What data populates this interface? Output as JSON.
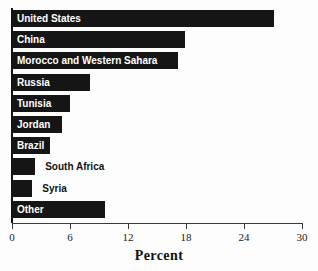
{
  "chart_data": {
    "type": "bar",
    "orientation": "horizontal",
    "title": "",
    "xlabel": "Percent",
    "ylabel": "",
    "xlim": [
      0,
      30
    ],
    "xticks": [
      0,
      6,
      12,
      18,
      24,
      30
    ],
    "xtick_labels": [
      "0",
      "6",
      "12",
      "18",
      "24",
      "30"
    ],
    "grid": false,
    "legend": null,
    "bar_color": "#151515",
    "background_color": "#fdfdfd",
    "categories": [
      "United States",
      "China",
      "Morocco and Western Sahara",
      "Russia",
      "Tunisia",
      "Jordan",
      "Brazil",
      "South Africa",
      "Syria",
      "Other"
    ],
    "values": [
      27.1,
      17.9,
      17.2,
      8.1,
      6.0,
      5.2,
      3.9,
      2.4,
      2.1,
      9.6
    ],
    "label_placement": [
      "inside",
      "inside",
      "inside",
      "inside",
      "inside",
      "inside",
      "inside",
      "outside",
      "outside",
      "inside"
    ]
  }
}
